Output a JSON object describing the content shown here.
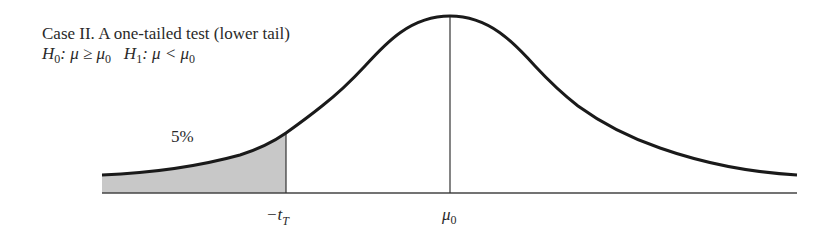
{
  "title": "Case II. A one-tailed test (lower tail)",
  "hypotheses": {
    "h0_symbol": "H",
    "h0_sub": "0",
    "h0_rel": ": μ ≥ μ",
    "h0_rel_sub": "0",
    "h1_symbol": "H",
    "h1_sub": "1",
    "h1_rel": ": μ < μ",
    "h1_rel_sub": "0"
  },
  "region": {
    "label": "5%",
    "fill": "#c8c8c8"
  },
  "axis": {
    "critical_label_prefix": "−t",
    "critical_label_sub": "T",
    "mean_label": "μ",
    "mean_label_sub": "0"
  },
  "colors": {
    "curve": "#1a1a1a",
    "axis": "#444444",
    "text": "#2a2a2a"
  }
}
